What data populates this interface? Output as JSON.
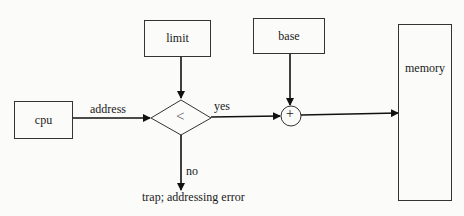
{
  "diagram": {
    "nodes": {
      "cpu": "cpu",
      "limit": "limit",
      "base": "base",
      "memory": "memory",
      "compare": "<",
      "adder": "+"
    },
    "edges": {
      "cpu_to_compare": "address",
      "compare_yes": "yes",
      "compare_no": "no"
    },
    "trap_text": "trap; addressing error"
  }
}
